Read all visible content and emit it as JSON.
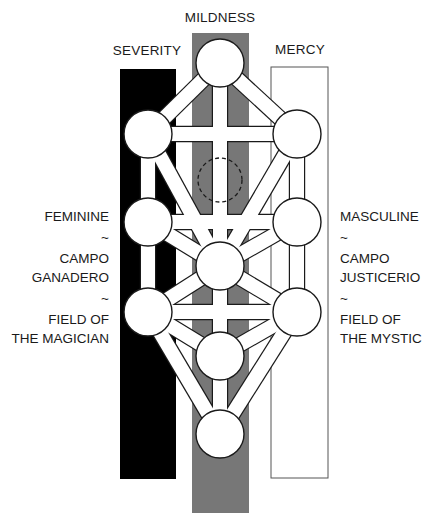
{
  "diagram": {
    "type": "tree-of-life",
    "colors": {
      "severity": "#000000",
      "mildness": "#777777",
      "mercy": "#ffffff",
      "outline": "#1a1a1a",
      "sephira_fill": "#ffffff"
    },
    "pillars": [
      {
        "id": "severity",
        "label": "SEVERITY",
        "x": 120,
        "y": 69,
        "w": 56,
        "h": 410,
        "fill": "#000000",
        "label_x": 147,
        "label_y": 43
      },
      {
        "id": "mildness",
        "label": "MILDNESS",
        "x": 192,
        "y": 33,
        "w": 57,
        "h": 480,
        "fill": "#777777",
        "label_x": 220,
        "label_y": 10
      },
      {
        "id": "mercy",
        "label": "MERCY",
        "x": 271,
        "y": 67,
        "w": 57,
        "h": 411,
        "fill": "#ffffff",
        "label_x": 300,
        "label_y": 42
      }
    ],
    "left_side_text": {
      "line1": "FEMININE",
      "sep1": "~",
      "line2": "CAMPO",
      "line3": "GANADERO",
      "sep2": "~",
      "line4": "FIELD OF",
      "line5": "THE MAGICIAN"
    },
    "right_side_text": {
      "line1": "MASCULINE",
      "sep1": "~",
      "line2": "CAMPO",
      "line3": "JUSTICERIO",
      "sep2": "~",
      "line4": "FIELD OF",
      "line5": "THE MYSTIC"
    },
    "nodes": [
      {
        "id": "top",
        "cx": 220,
        "cy": 63
      },
      {
        "id": "left_upper",
        "cx": 148,
        "cy": 134
      },
      {
        "id": "right_upper",
        "cx": 297,
        "cy": 134
      },
      {
        "id": "hidden",
        "cx": 220,
        "cy": 180,
        "dashed": true
      },
      {
        "id": "left_mid",
        "cx": 148,
        "cy": 222
      },
      {
        "id": "right_mid",
        "cx": 297,
        "cy": 222
      },
      {
        "id": "center",
        "cx": 220,
        "cy": 266
      },
      {
        "id": "left_lower",
        "cx": 148,
        "cy": 312
      },
      {
        "id": "right_lower",
        "cx": 297,
        "cy": 312
      },
      {
        "id": "lower_center",
        "cx": 220,
        "cy": 356
      },
      {
        "id": "bottom",
        "cx": 220,
        "cy": 434
      }
    ],
    "node_radius": 24,
    "path_width": 14,
    "paths": [
      [
        "top",
        "left_upper"
      ],
      [
        "top",
        "right_upper"
      ],
      [
        "top",
        "center"
      ],
      [
        "left_upper",
        "right_upper"
      ],
      [
        "left_upper",
        "left_mid"
      ],
      [
        "right_upper",
        "right_mid"
      ],
      [
        "left_upper",
        "center"
      ],
      [
        "right_upper",
        "center"
      ],
      [
        "left_mid",
        "right_mid"
      ],
      [
        "left_mid",
        "center"
      ],
      [
        "right_mid",
        "center"
      ],
      [
        "left_mid",
        "left_lower"
      ],
      [
        "right_mid",
        "right_lower"
      ],
      [
        "left_lower",
        "center"
      ],
      [
        "right_lower",
        "center"
      ],
      [
        "left_lower",
        "right_lower"
      ],
      [
        "left_lower",
        "lower_center"
      ],
      [
        "right_lower",
        "lower_center"
      ],
      [
        "center",
        "lower_center"
      ],
      [
        "lower_center",
        "bottom"
      ],
      [
        "left_lower",
        "bottom"
      ],
      [
        "right_lower",
        "bottom"
      ]
    ]
  }
}
